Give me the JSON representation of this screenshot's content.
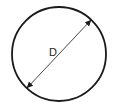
{
  "diagram": {
    "type": "circle-with-diameter",
    "label": "D",
    "circle": {
      "cx": 59,
      "cy": 54,
      "r": 47,
      "stroke": "#1a1a1a",
      "stroke_width": 1.8
    },
    "diameter_line": {
      "x1": 27,
      "y1": 88,
      "x2": 91,
      "y2": 20,
      "stroke": "#333333",
      "arrowheads": "both"
    },
    "label_position": {
      "x": 49,
      "y": 56
    },
    "colors": {
      "background": "#ffffff",
      "stroke": "#1a1a1a"
    }
  }
}
